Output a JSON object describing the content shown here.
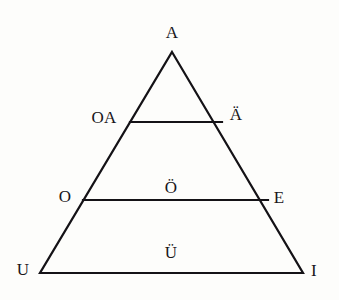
{
  "diagram": {
    "name": "vowel-triangle",
    "background_color": "#fdfdfb",
    "stroke_color": "#141216",
    "text_color": "#18161a",
    "stroke_width": 2.2,
    "canvas": {
      "width": 339,
      "height": 300
    },
    "geometry": {
      "apex": {
        "x": 172,
        "y": 52
      },
      "bottom_left": {
        "x": 40,
        "y": 273
      },
      "bottom_right": {
        "x": 303,
        "y": 273
      },
      "divider_upper": {
        "y": 122,
        "x_start": 130,
        "x_end": 222
      },
      "divider_middle": {
        "y": 200,
        "x_start": 83,
        "x_end": 268
      }
    },
    "labels": [
      {
        "id": "apex",
        "text": "A",
        "x": 172,
        "y": 32,
        "role": "apex-vertex"
      },
      {
        "id": "upper-left",
        "text": "OA",
        "x": 104,
        "y": 117,
        "role": "band-edge-left"
      },
      {
        "id": "upper-right",
        "text": "Ä",
        "x": 236,
        "y": 114,
        "role": "band-edge-right"
      },
      {
        "id": "middle-left",
        "text": "O",
        "x": 65,
        "y": 196,
        "role": "band-edge-left"
      },
      {
        "id": "middle-center",
        "text": "Ö",
        "x": 171,
        "y": 187,
        "role": "band-interior"
      },
      {
        "id": "middle-right",
        "text": "E",
        "x": 279,
        "y": 197,
        "role": "band-edge-right"
      },
      {
        "id": "base-left",
        "text": "U",
        "x": 23,
        "y": 269,
        "role": "base-vertex-left"
      },
      {
        "id": "base-center",
        "text": "Ü",
        "x": 171,
        "y": 252,
        "role": "band-interior"
      },
      {
        "id": "base-right",
        "text": "I",
        "x": 314,
        "y": 270,
        "role": "base-vertex-right"
      }
    ]
  }
}
